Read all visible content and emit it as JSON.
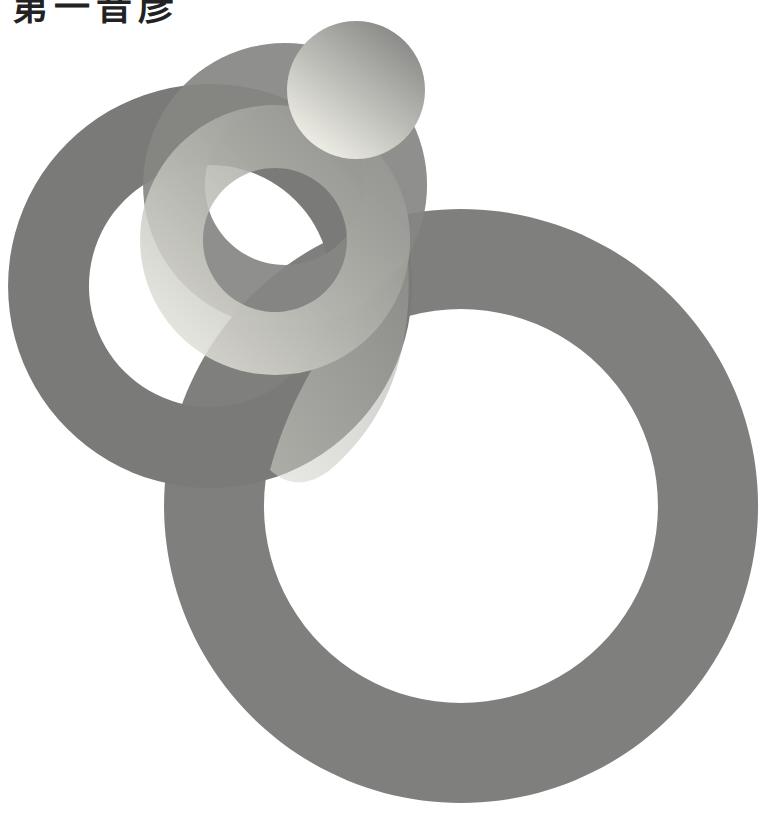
{
  "heading": {
    "text": "第一音彦",
    "note": "cropped at top edge"
  },
  "artwork": {
    "description": "Overlapping gray rings and sphere",
    "colors": {
      "dark": "#7a7a78",
      "mid": "#8e8e8c",
      "light": "#e8e8e0",
      "background": "#ffffff"
    },
    "large_ring": {
      "cx": 461,
      "cy": 506,
      "outer_r": 297,
      "inner_r": 197
    },
    "left_ring": {
      "cx": 210,
      "cy": 286,
      "outer_r": 202,
      "inner_r": 121
    },
    "dark_mid_ring": {
      "cx": 285,
      "cy": 185,
      "outer_r": 142,
      "inner_r": 80
    },
    "gradient_ring": {
      "cx": 275,
      "cy": 240,
      "outer_r": 135,
      "inner_r": 72
    },
    "sphere": {
      "cx": 356,
      "cy": 90,
      "r": 69
    }
  }
}
